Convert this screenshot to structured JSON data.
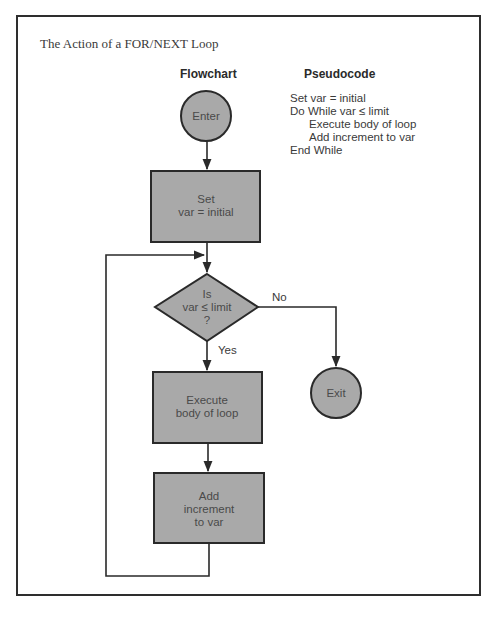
{
  "figure": {
    "title": "The Action of a FOR/NEXT Loop",
    "flowchart_heading": "Flowchart",
    "pseudocode_heading": "Pseudocode"
  },
  "pseudocode": {
    "lines": [
      {
        "text": "Set var = initial",
        "indent": 0
      },
      {
        "text": "Do While var ≤ limit",
        "indent": 0
      },
      {
        "text": "Execute body of loop",
        "indent": 1
      },
      {
        "text": "Add increment to var",
        "indent": 1
      },
      {
        "text": "End While",
        "indent": 0
      }
    ]
  },
  "flowchart": {
    "colors": {
      "fill": "#a9a9a9",
      "stroke": "#2a2a2a",
      "text": "#4a4a4a"
    },
    "nodes": {
      "enter": {
        "shape": "circle",
        "lines": [
          "Enter"
        ]
      },
      "set": {
        "shape": "rect",
        "lines": [
          "Set",
          "var = initial"
        ]
      },
      "decision": {
        "shape": "diamond",
        "lines": [
          "Is",
          "var ≤ limit",
          "?"
        ]
      },
      "execute": {
        "shape": "rect",
        "lines": [
          "Execute",
          "body of loop"
        ]
      },
      "add": {
        "shape": "rect",
        "lines": [
          "Add",
          "increment",
          "to var"
        ]
      },
      "exit": {
        "shape": "circle",
        "lines": [
          "Exit"
        ]
      }
    },
    "edges": {
      "no_label": "No",
      "yes_label": "Yes"
    }
  }
}
